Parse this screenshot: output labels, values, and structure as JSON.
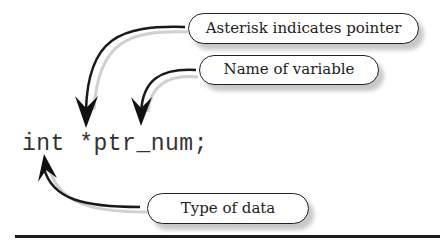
{
  "diagram": {
    "code_line": "int *ptr_num;",
    "callouts": [
      {
        "label": "Asterisk indicates pointer",
        "points_to": "*"
      },
      {
        "label": "Name of variable",
        "points_to": "ptr_num"
      },
      {
        "label": "Type of data",
        "points_to": "int"
      }
    ]
  },
  "colors": {
    "stroke": "#1a1a1a",
    "shadow": "#c8c8c8",
    "background": "#ffffff"
  }
}
